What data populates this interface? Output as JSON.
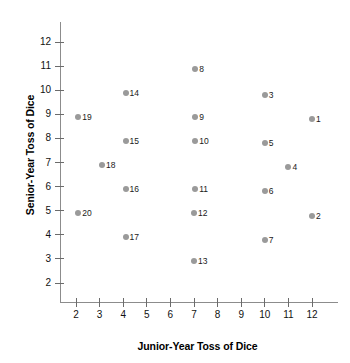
{
  "chart_data": {
    "type": "scatter",
    "title": "",
    "xlabel": "Junior-Year Toss of Dice",
    "ylabel": "Senior-Year Toss of Dice",
    "xlim": [
      1.4,
      12.8
    ],
    "ylim": [
      1.2,
      12.6
    ],
    "xticks": [
      2,
      3,
      4,
      5,
      6,
      7,
      8,
      9,
      10,
      11,
      12
    ],
    "xtick_labels": [
      "2",
      "3",
      "4",
      "5",
      "6",
      "7",
      "8",
      "9",
      "10",
      "11",
      "12"
    ],
    "yticks": [
      2,
      3,
      4,
      5,
      6,
      7,
      8,
      9,
      10,
      11,
      12
    ],
    "ytick_labels": [
      "2",
      "3",
      "4",
      "5",
      "6",
      "7",
      "8",
      "9",
      "10",
      "11",
      "12"
    ],
    "grid": false,
    "legend": false,
    "marker_color": "#9a9a9a",
    "axis_color": "#8c8c8c",
    "points": [
      {
        "label": "1",
        "x": 12.0,
        "y": 8.8
      },
      {
        "label": "2",
        "x": 12.0,
        "y": 4.8
      },
      {
        "label": "3",
        "x": 10.0,
        "y": 9.8
      },
      {
        "label": "4",
        "x": 11.0,
        "y": 6.8
      },
      {
        "label": "5",
        "x": 10.0,
        "y": 7.8
      },
      {
        "label": "6",
        "x": 10.0,
        "y": 5.8
      },
      {
        "label": "7",
        "x": 10.0,
        "y": 3.8
      },
      {
        "label": "8",
        "x": 7.05,
        "y": 10.9
      },
      {
        "label": "9",
        "x": 7.05,
        "y": 8.9
      },
      {
        "label": "10",
        "x": 7.05,
        "y": 7.9
      },
      {
        "label": "11",
        "x": 7.05,
        "y": 5.9
      },
      {
        "label": "12",
        "x": 7.0,
        "y": 4.9
      },
      {
        "label": "13",
        "x": 7.0,
        "y": 2.9
      },
      {
        "label": "14",
        "x": 4.1,
        "y": 9.9
      },
      {
        "label": "15",
        "x": 4.1,
        "y": 7.9
      },
      {
        "label": "16",
        "x": 4.1,
        "y": 5.9
      },
      {
        "label": "17",
        "x": 4.1,
        "y": 3.9
      },
      {
        "label": "18",
        "x": 3.1,
        "y": 6.9
      },
      {
        "label": "19",
        "x": 2.1,
        "y": 8.9
      },
      {
        "label": "20",
        "x": 2.1,
        "y": 4.9
      }
    ]
  }
}
